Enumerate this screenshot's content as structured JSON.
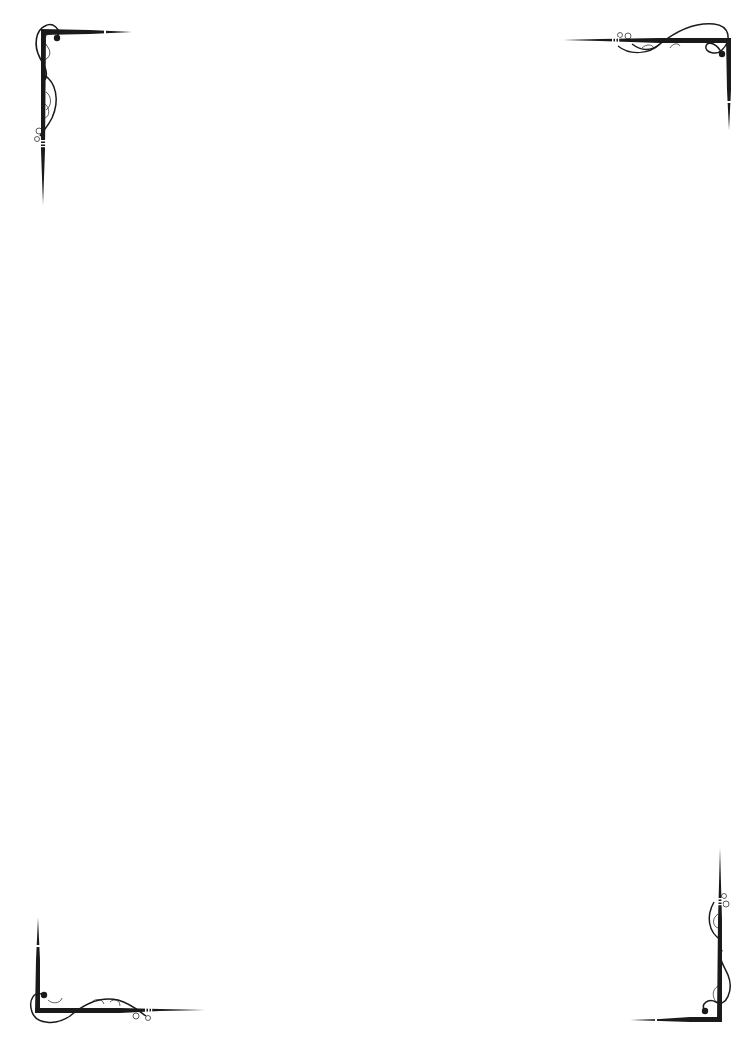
{
  "page": {
    "background": "#ffffff",
    "ink_color": "#1a1a1a",
    "width": 756,
    "height": 1054
  },
  "ornaments": {
    "style": "calligraphic flourish corner frame",
    "corners": [
      {
        "position": "top-left",
        "icon": "flourish-corner-icon"
      },
      {
        "position": "top-right",
        "icon": "flourish-corner-icon"
      },
      {
        "position": "bottom-left",
        "icon": "flourish-corner-icon"
      },
      {
        "position": "bottom-right",
        "icon": "flourish-corner-icon"
      }
    ]
  },
  "content": {
    "text": ""
  }
}
